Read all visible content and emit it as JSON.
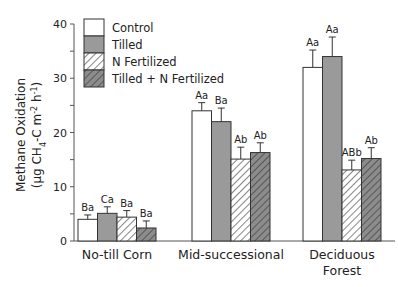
{
  "chart_data": {
    "type": "bar",
    "title": "",
    "xlabel": "",
    "ylabel": "Methane Oxidation",
    "ylabel_units": "(μg CH4-C m-2 h-1)",
    "ylim": [
      0,
      40
    ],
    "yticks": [
      0,
      10,
      20,
      30,
      40
    ],
    "categories": [
      "No-till Corn",
      "Mid-successional",
      "Deciduous Forest"
    ],
    "category_lines": [
      [
        "No-till Corn"
      ],
      [
        "Mid-successional"
      ],
      [
        "Deciduous",
        "Forest"
      ]
    ],
    "series": [
      {
        "name": "Control",
        "style": "white",
        "values": [
          4.0,
          24.0,
          32.0
        ],
        "errors": [
          0.8,
          1.5,
          3.2
        ],
        "labels": [
          "Ba",
          "Aa",
          "Aa"
        ]
      },
      {
        "name": "Tilled",
        "style": "gray",
        "values": [
          5.1,
          22.0,
          34.0
        ],
        "errors": [
          1.2,
          2.5,
          3.6
        ],
        "labels": [
          "Ca",
          "Ba",
          "Aa"
        ]
      },
      {
        "name": "N Fertilized",
        "style": "hatch-white",
        "values": [
          4.4,
          15.1,
          13.1
        ],
        "errors": [
          1.2,
          2.2,
          1.8
        ],
        "labels": [
          "Ba",
          "Ab",
          "ABb"
        ]
      },
      {
        "name": "Tilled + N Fertilized",
        "style": "hatch-gray",
        "values": [
          2.4,
          16.3,
          15.2
        ],
        "errors": [
          1.3,
          1.8,
          2.0
        ],
        "labels": [
          "Ba",
          "Ab",
          "Ab"
        ]
      }
    ],
    "legend_position": "upper-left",
    "grid": false
  },
  "colors": {
    "gray_fill": "#9a9a9a",
    "hatch_gray_fill": "#8c8c8c",
    "axis": "#555555",
    "text": "#222222"
  }
}
